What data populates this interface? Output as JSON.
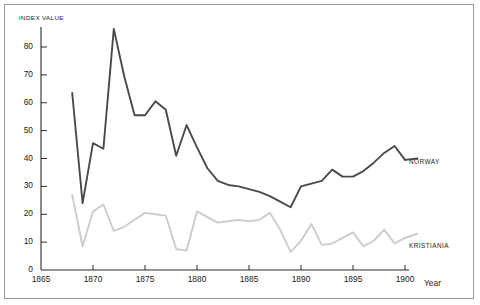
{
  "figure": {
    "frame_color": "#9b9b9b",
    "background": "#ffffff"
  },
  "chart_data": {
    "type": "line",
    "title": "",
    "subtitle": "",
    "ylabel": "INDEX VALUE",
    "xlabel": "Year",
    "grid": false,
    "legend_position": "inline-right",
    "xlim": [
      1865,
      1902
    ],
    "ylim": [
      0,
      88
    ],
    "yticks": [
      0,
      10,
      20,
      30,
      40,
      50,
      60,
      70,
      80
    ],
    "ytick_labels": [
      "0",
      "10",
      "20",
      "30",
      "40",
      "50",
      "60",
      "70",
      "80"
    ],
    "xticks": [
      1865,
      1870,
      1875,
      1880,
      1885,
      1890,
      1895,
      1900
    ],
    "xtick_labels": [
      "1865",
      "1870",
      "1875",
      "1880",
      "1885",
      "1890",
      "1895",
      "1900"
    ],
    "series": [
      {
        "name": "NORWAY",
        "color": "#4a4a4a",
        "label_x": 1901,
        "label_y": 40,
        "x": [
          1868,
          1869,
          1870,
          1871,
          1872,
          1873,
          1874,
          1875,
          1876,
          1877,
          1878,
          1879,
          1880,
          1881,
          1882,
          1883,
          1884,
          1885,
          1886,
          1887,
          1888,
          1889,
          1890,
          1891,
          1892,
          1893,
          1894,
          1895,
          1896,
          1897,
          1898,
          1899,
          1900
        ],
        "values": [
          63.5,
          24.0,
          45.5,
          43.5,
          86.5,
          69.5,
          55.5,
          55.5,
          60.5,
          57.5,
          41.0,
          52.0,
          44.0,
          36.5,
          32.0,
          30.5,
          30.0,
          29.0,
          28.0,
          26.5,
          24.5,
          22.5,
          30.0,
          31.0,
          32.0,
          36.0,
          33.5,
          33.5,
          35.5,
          38.5,
          42.0,
          44.5,
          39.5
        ]
      },
      {
        "name": "KRISTIANIA",
        "color": "#cccccc",
        "label_x": 1901,
        "label_y": 13,
        "x": [
          1868,
          1869,
          1870,
          1871,
          1872,
          1873,
          1874,
          1875,
          1876,
          1877,
          1878,
          1879,
          1880,
          1881,
          1882,
          1883,
          1884,
          1885,
          1886,
          1887,
          1888,
          1889,
          1890,
          1891,
          1892,
          1893,
          1894,
          1895,
          1896,
          1897,
          1898,
          1899,
          1900
        ],
        "values": [
          27.0,
          8.5,
          21.0,
          23.5,
          14.0,
          15.5,
          18.0,
          20.5,
          20.0,
          19.5,
          7.5,
          7.0,
          21.0,
          19.0,
          17.0,
          17.5,
          18.0,
          17.5,
          18.0,
          20.5,
          14.5,
          6.5,
          10.5,
          16.5,
          9.0,
          9.5,
          11.5,
          13.5,
          8.5,
          10.5,
          14.5,
          9.5,
          11.5
        ]
      }
    ]
  }
}
